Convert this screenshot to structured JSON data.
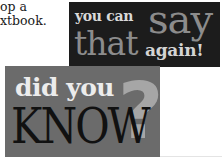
{
  "body_text": {
    "lines": [
      "op a",
      "xtbook."
    ]
  },
  "you_can_say_that_again": {
    "line1_small": "you can",
    "line1_large": "say",
    "line2_large": "that",
    "line2_small": "again!",
    "colors": {
      "background": "#1c1c1c",
      "accent_text": "#8c8c8c",
      "light_text": "#d9d9d9"
    }
  },
  "did_you_know": {
    "line1": "did you",
    "line2": "KNOW",
    "question_mark": "?",
    "colors": {
      "background": "#6b6b6b",
      "line1_text": "#ececec",
      "line2_text": "#111111",
      "question_mark": "#a6a6a6"
    }
  }
}
